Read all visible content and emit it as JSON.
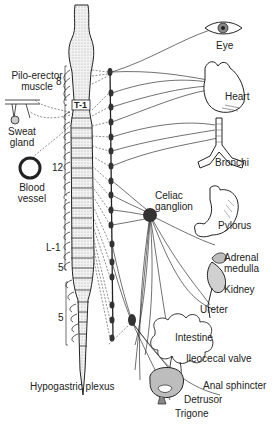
{
  "diagram": {
    "labels": {
      "pilo_erector": "Pilo-erector muscle",
      "pilo_line1": "Pilo-erector",
      "pilo_line2": "muscle",
      "sweat_line1": "Sweat",
      "sweat_line2": "gland",
      "blood_line1": "Blood",
      "blood_line2": "vessel",
      "eye": "Eye",
      "heart": "Heart",
      "bronchi": "Bronchi",
      "celiac_line1": "Celiac",
      "celiac_line2": "ganglion",
      "pylorus": "Pylorus",
      "adrenal_line1": "Adrenal",
      "adrenal_line2": "medulla",
      "kidney": "Kidney",
      "ureter": "Ureter",
      "intestine": "Intestine",
      "ileocecal": "Ileocecal valve",
      "anal": "Anal sphincter",
      "detrusor": "Detrusor",
      "trigone": "Trigone",
      "hypogastric": "Hypogastric plexus"
    },
    "segments": {
      "cervical": "8",
      "t1": "T-1",
      "thoracic": "12",
      "l1": "L-1",
      "lumbar": "5",
      "sacral": "5"
    },
    "colors": {
      "ink": "#222222",
      "stipple": "#d9d9d9",
      "organ_shade": "#bdbdbd",
      "background": "#ffffff"
    }
  }
}
